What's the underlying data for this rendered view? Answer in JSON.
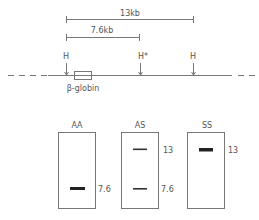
{
  "map": {
    "span_13": "13kb",
    "span_76": "7.6kb",
    "sites": [
      {
        "label": "H"
      },
      {
        "label": "H*"
      },
      {
        "label": "H"
      }
    ],
    "gene_label": "β-globin"
  },
  "gels": [
    {
      "genotype": "AA",
      "bands": [
        {
          "label": "7.6",
          "size_kb": 7.6,
          "weight": "heavy"
        }
      ]
    },
    {
      "genotype": "AS",
      "bands": [
        {
          "label": "13",
          "size_kb": 13,
          "weight": "light"
        },
        {
          "label": "7.6",
          "size_kb": 7.6,
          "weight": "light"
        }
      ]
    },
    {
      "genotype": "SS",
      "bands": [
        {
          "label": "13",
          "size_kb": 13,
          "weight": "heavy"
        }
      ]
    }
  ]
}
